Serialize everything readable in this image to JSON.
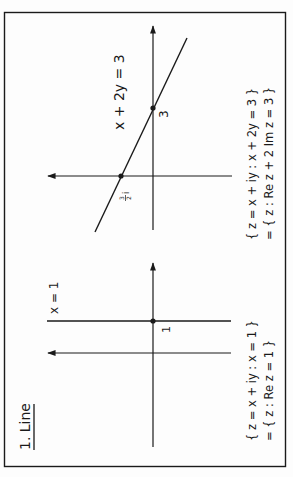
{
  "title": "1. Line",
  "colors": {
    "ink": "#1a1a1a",
    "background": "#fdfdfd"
  },
  "rotation": "Figure rotated 90° counter-clockwise",
  "panels": [
    {
      "id": "vertical-line",
      "line_label": "x = 1",
      "point_labels": [
        "1"
      ],
      "set_line1": "{ z = x + iy : x = 1 }",
      "set_line2": "= { z : Re z = 1 }"
    },
    {
      "id": "slanted-line",
      "line_label": "x + 2y = 3",
      "point_labels": [
        "3",
        "3/2 i"
      ],
      "point_label_real": "3",
      "point_label_imag_num": "3",
      "point_label_imag_den": "2",
      "point_label_imag_unit": "i",
      "set_line1": "{ z = x + iy : x + 2y = 3 }",
      "set_line2": "= { z : Re z + 2 Im z = 3 }"
    }
  ]
}
